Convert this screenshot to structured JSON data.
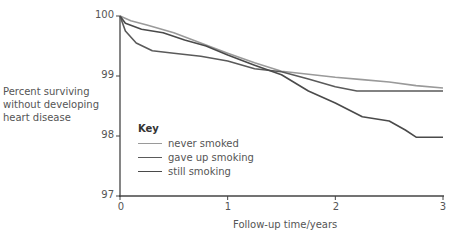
{
  "chart_data": {
    "type": "line",
    "title": "",
    "xlabel": "Follow-up time/years",
    "ylabel": "Percent surviving without developing heart disease",
    "ylabel_lines": [
      "Percent surviving",
      "without developing",
      "heart disease"
    ],
    "xlim": [
      0,
      3
    ],
    "ylim": [
      97,
      100
    ],
    "x_ticks": [
      0,
      1,
      2,
      3
    ],
    "y_ticks": [
      97,
      98,
      99,
      100
    ],
    "grid": false,
    "legend": {
      "title": "Key",
      "position": "inside-lower-left"
    },
    "series": [
      {
        "name": "never smoked",
        "color": "#9a9a9a",
        "x": [
          0,
          0.1,
          0.25,
          0.5,
          0.75,
          1.0,
          1.25,
          1.5,
          1.75,
          2.0,
          2.25,
          2.5,
          2.75,
          3.0
        ],
        "y": [
          100,
          99.92,
          99.85,
          99.72,
          99.55,
          99.38,
          99.22,
          99.08,
          99.03,
          98.98,
          98.94,
          98.9,
          98.84,
          98.8
        ]
      },
      {
        "name": "gave up smoking",
        "color": "#5a5a5a",
        "x": [
          0,
          0.05,
          0.15,
          0.3,
          0.5,
          0.75,
          1.0,
          1.25,
          1.5,
          1.75,
          2.0,
          2.2,
          2.5,
          3.0
        ],
        "y": [
          100,
          99.75,
          99.55,
          99.42,
          99.38,
          99.33,
          99.25,
          99.12,
          99.07,
          98.95,
          98.82,
          98.75,
          98.75,
          98.75
        ]
      },
      {
        "name": "still smoking",
        "color": "#4a4a4a",
        "x": [
          0,
          0.05,
          0.2,
          0.4,
          0.6,
          0.8,
          1.0,
          1.25,
          1.5,
          1.75,
          2.0,
          2.25,
          2.5,
          2.65,
          2.75,
          3.0
        ],
        "y": [
          100,
          99.88,
          99.78,
          99.72,
          99.6,
          99.5,
          99.35,
          99.18,
          99.02,
          98.75,
          98.55,
          98.32,
          98.25,
          98.1,
          97.98,
          97.98
        ]
      }
    ]
  },
  "axis": {
    "y_tick_labels": [
      "100",
      "99",
      "98",
      "97"
    ],
    "x_tick_labels": [
      "0",
      "1",
      "2",
      "3"
    ]
  },
  "legend": {
    "title": "Key",
    "items": [
      {
        "label": "never smoked",
        "color": "#9a9a9a"
      },
      {
        "label": "gave up smoking",
        "color": "#5a5a5a"
      },
      {
        "label": "still smoking",
        "color": "#4a4a4a"
      }
    ]
  }
}
